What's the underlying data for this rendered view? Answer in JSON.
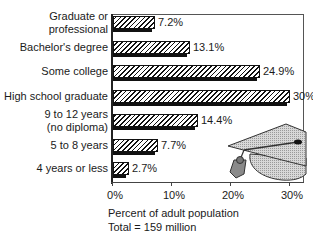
{
  "chart_data": {
    "type": "bar",
    "orientation": "horizontal",
    "title": "",
    "categories": [
      "Graduate or professional",
      "Bachelor's degree",
      "Some college",
      "High school graduate",
      "9 to 12 years (no diploma)",
      "5 to 8 years",
      "4 years or less"
    ],
    "category_lines": [
      [
        "Graduate or",
        "professional"
      ],
      [
        "Bachelor's degree"
      ],
      [
        "Some college"
      ],
      [
        "High school graduate"
      ],
      [
        "9 to 12 years",
        "(no diploma)"
      ],
      [
        "5 to 8 years"
      ],
      [
        "4 years or less"
      ]
    ],
    "values": [
      7.2,
      13.1,
      24.9,
      30,
      14.4,
      7.7,
      2.7
    ],
    "value_labels": [
      "7.2%",
      "13.1%",
      "24.9%",
      "30%",
      "14.4%",
      "7.7%",
      "2.7%"
    ],
    "xlabel": "Percent of adult population",
    "footnote": "Total = 159 million",
    "xlim": [
      0,
      32
    ],
    "xticks": [
      0,
      10,
      20,
      30
    ],
    "xtick_labels": [
      "0%",
      "10%",
      "20%",
      "30%"
    ],
    "grid": false,
    "legend": null,
    "bar_style": "diagonal hatch with black drop shadow",
    "decoration": "graduation-cap illustration (lower right)"
  }
}
